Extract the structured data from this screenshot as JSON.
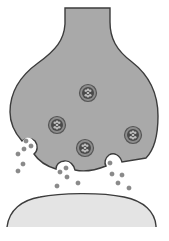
{
  "diagram": {
    "colors": {
      "background": "#ffffff",
      "presynaptic_fill": "#a9a9a9",
      "outline": "#3c3c3c",
      "postsynaptic_fill": "#e4e4e4",
      "vesicle_ring": "#555555",
      "vesicle_core": "#4a4a4a",
      "vesicle_dot": "#bdbdbd",
      "neurotransmitter": "#8a8a8a"
    },
    "parts": [
      {
        "name": "presynaptic-terminal",
        "label": ""
      },
      {
        "name": "synaptic-vesicle",
        "label": ""
      },
      {
        "name": "synaptic-cleft",
        "label": ""
      },
      {
        "name": "postsynaptic-membrane",
        "label": ""
      }
    ],
    "vesicles": [
      {
        "cx": 88,
        "cy": 93
      },
      {
        "cx": 57,
        "cy": 125
      },
      {
        "cx": 85,
        "cy": 148
      },
      {
        "cx": 133,
        "cy": 135
      }
    ],
    "exocytosis_sites": [
      {
        "cx": 28,
        "cy": 143
      },
      {
        "cx": 66,
        "cy": 167
      },
      {
        "cx": 113,
        "cy": 164
      }
    ],
    "neurotransmitters": [
      {
        "cx": 26,
        "cy": 141
      },
      {
        "cx": 31,
        "cy": 146
      },
      {
        "cx": 24,
        "cy": 149
      },
      {
        "cx": 18,
        "cy": 154
      },
      {
        "cx": 23,
        "cy": 164
      },
      {
        "cx": 18,
        "cy": 171
      },
      {
        "cx": 60,
        "cy": 172
      },
      {
        "cx": 66,
        "cy": 168
      },
      {
        "cx": 67,
        "cy": 177
      },
      {
        "cx": 57,
        "cy": 186
      },
      {
        "cx": 78,
        "cy": 183
      },
      {
        "cx": 110,
        "cy": 163
      },
      {
        "cx": 112,
        "cy": 174
      },
      {
        "cx": 122,
        "cy": 175
      },
      {
        "cx": 118,
        "cy": 183
      },
      {
        "cx": 129,
        "cy": 188
      }
    ]
  }
}
